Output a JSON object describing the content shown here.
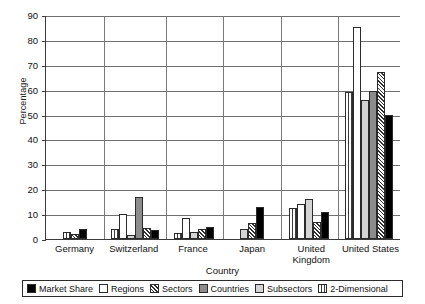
{
  "chart_data": {
    "type": "bar",
    "title": "",
    "xlabel": "Country",
    "ylabel": "Percentage",
    "ylim": [
      0,
      90
    ],
    "ytick_step": 10,
    "yticks": [
      90,
      80,
      70,
      60,
      50,
      40,
      30,
      20,
      10,
      0
    ],
    "grid": true,
    "legend_position": "bottom",
    "categories": [
      "Germany",
      "Switzerland",
      "France",
      "Japan",
      "United Kingdom",
      "United States"
    ],
    "series": [
      {
        "name": "Market Share",
        "fill": "solid",
        "values": [
          4,
          3.5,
          5,
          13,
          11,
          50
        ]
      },
      {
        "name": "Regions",
        "fill": "white",
        "values": [
          0,
          10,
          8.5,
          0,
          14,
          85
        ]
      },
      {
        "name": "Sectors",
        "fill": "hatch",
        "values": [
          2,
          4.5,
          4,
          6.5,
          7,
          67
        ]
      },
      {
        "name": "Countries",
        "fill": "dark",
        "values": [
          0,
          17,
          0,
          0,
          0,
          59.5
        ]
      },
      {
        "name": "Subsectors",
        "fill": "light",
        "values": [
          0,
          1.5,
          3,
          4,
          16,
          56
        ]
      },
      {
        "name": "2-Dimensional",
        "fill": "vstripe",
        "values": [
          3,
          4,
          2.5,
          0,
          12.5,
          59
        ]
      }
    ],
    "bar_order_in_group": [
      "2-Dimensional",
      "Regions",
      "Subsectors",
      "Countries",
      "Sectors",
      "Market Share"
    ]
  },
  "legend": {
    "items": [
      {
        "label": "Market Share",
        "fill": "solid"
      },
      {
        "label": "Regions",
        "fill": "white"
      },
      {
        "label": "Sectors",
        "fill": "hatch"
      },
      {
        "label": "Countries",
        "fill": "dark"
      },
      {
        "label": "Subsectors",
        "fill": "light"
      },
      {
        "label": "2-Dimensional",
        "fill": "vstripe"
      }
    ]
  },
  "colors": {
    "axis": "#3a3a3a",
    "grid": "#6f6f6f",
    "market_share": "#000000",
    "regions": "#ffffff",
    "countries": "#8c8c8c",
    "subsectors": "#d4d4d4"
  }
}
